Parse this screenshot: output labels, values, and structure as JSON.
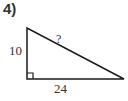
{
  "problem": {
    "number": "4)",
    "triangle": {
      "type": "right-triangle",
      "vertical_leg_label": "10",
      "horizontal_leg_label": "24",
      "hypotenuse_label": "?",
      "right_angle_marker": true,
      "stroke_color": "#1a1a1a"
    }
  }
}
